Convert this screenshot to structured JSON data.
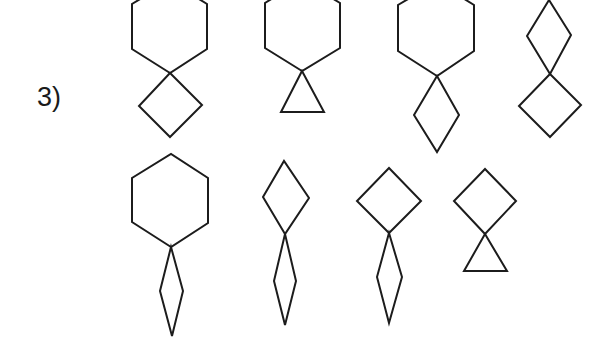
{
  "problem": {
    "label": "3)",
    "description": "Sequence of compound figures made of polygons joined at a single vertex",
    "rows": [
      {
        "row": 1,
        "figures": [
          {
            "id": 1,
            "upper": "hexagon",
            "lower": "square",
            "upper_points": "170,73 132,49 132,4 170,-19 207,4 207,49",
            "lower_points": "170,73 202,105 170,137 139,106"
          },
          {
            "id": 2,
            "upper": "hexagon",
            "lower": "triangle",
            "upper_points": "302,71 265,48 265,3 302,-20 340,3 340,48",
            "lower_points": "302,71 324,112 281,112"
          },
          {
            "id": 3,
            "upper": "hexagon",
            "lower": "rhombus",
            "upper_points": "437,76 398,51 398,5 437,-18 474,5 474,51",
            "lower_points": "437,76 459,115 437,152 414,115"
          },
          {
            "id": 4,
            "upper": "rhombus",
            "lower": "square",
            "upper_points": "550,74 527,36 549,0 571,35",
            "lower_points": "550,74 581,105 550,137 519,106"
          }
        ]
      },
      {
        "row": 2,
        "figures": [
          {
            "id": 5,
            "upper": "hexagon",
            "lower": "narrow-rhombus",
            "upper_points": "171,247 132,222 132,178 171,154 208,178 208,223",
            "lower_points": "171,247 183,291 172,336 160,291"
          },
          {
            "id": 6,
            "upper": "rhombus",
            "lower": "narrow-rhombus",
            "upper_points": "285,234 263,197 284,161 309,198",
            "lower_points": "285,234 296,281 285,325 274,281"
          },
          {
            "id": 7,
            "upper": "square",
            "lower": "narrow-rhombus",
            "upper_points": "389,233 357,201 389,168 421,201",
            "lower_points": "389,233 402,277 389,323 377,277"
          },
          {
            "id": 8,
            "upper": "square",
            "lower": "triangle",
            "upper_points": "485,234 454,201 485,169 516,201",
            "lower_points": "485,234 507,271 464,271"
          }
        ]
      }
    ]
  },
  "colors": {
    "background": "#ffffff",
    "stroke": "#1c1c1c",
    "text": "#1a1a1a"
  }
}
